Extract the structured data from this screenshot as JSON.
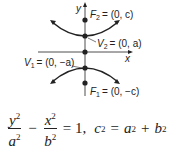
{
  "diagram": {
    "type": "hyperbola-vertical-transverse-axis",
    "axes": {
      "x_label": "x",
      "y_label": "y"
    },
    "points": [
      {
        "name": "F2",
        "label_sub": "2",
        "coords": "(0, c)"
      },
      {
        "name": "V2",
        "label_sub": "2",
        "coords": "(0, a)"
      },
      {
        "name": "V1",
        "label_sub": "1",
        "coords": "(0, −a)"
      },
      {
        "name": "F1",
        "label_sub": "1",
        "coords": "(0, −c)"
      }
    ],
    "labels": {
      "f2": "= (0, c)",
      "v2": "= (0, a)",
      "v1": "= (0, −a)",
      "f1": "= (0, −c)"
    },
    "equation": {
      "num1": "y",
      "den1": "a",
      "minus": "−",
      "num2": "x",
      "den2": "b",
      "equals_one": "= 1,",
      "c": "c",
      "eq": "=",
      "a": "a",
      "plus": "+",
      "b": "b",
      "exp": "2"
    }
  }
}
